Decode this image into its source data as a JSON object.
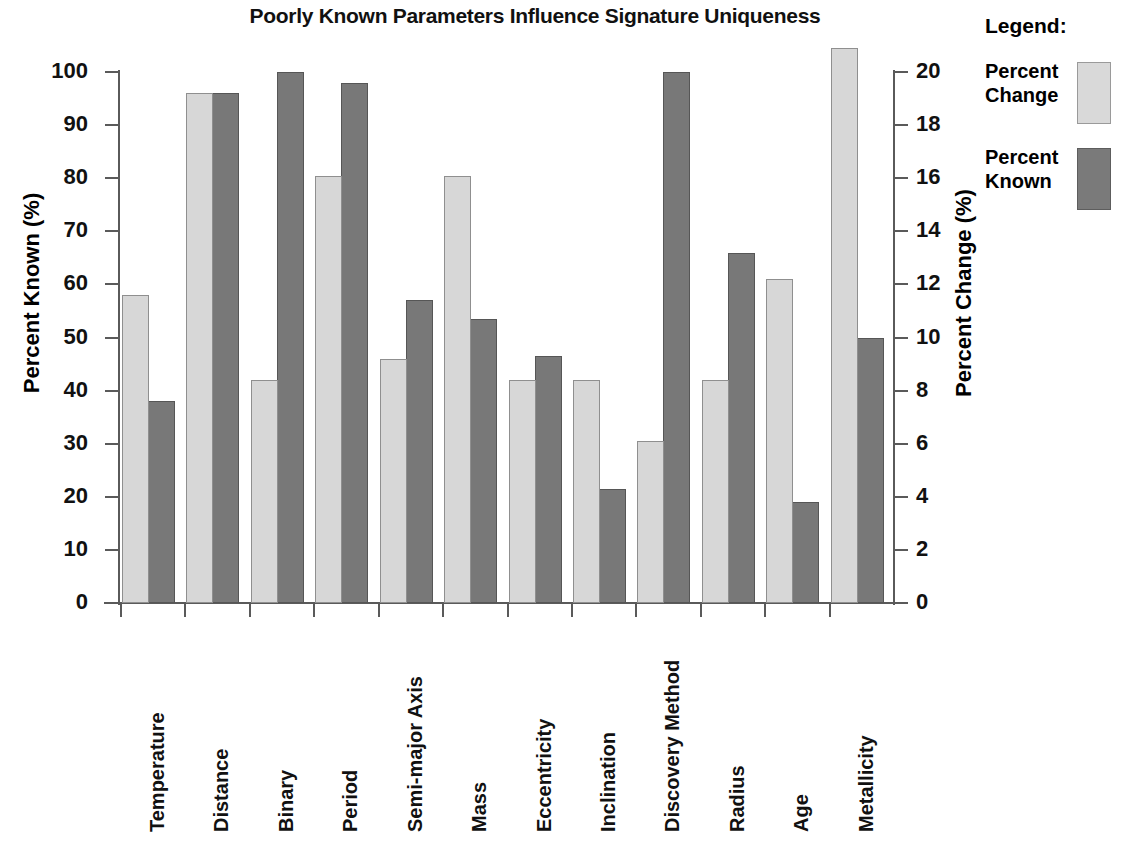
{
  "chart_data": {
    "type": "bar",
    "title": "Poorly Known Parameters Influence Signature Uniqueness",
    "xlabel": "",
    "ylabel": "Percent Known (%)",
    "y2label": "Percent Change (%)",
    "ylim": [
      0,
      100
    ],
    "y2lim": [
      0,
      20
    ],
    "yticks": [
      "0",
      "10",
      "20",
      "30",
      "40",
      "50",
      "60",
      "70",
      "80",
      "90",
      "100"
    ],
    "y2ticks": [
      "0",
      "2",
      "4",
      "6",
      "8",
      "10",
      "12",
      "14",
      "16",
      "18",
      "20"
    ],
    "grid": false,
    "legend_position": "right",
    "categories": [
      "Temperature",
      "Distance",
      "Binary",
      "Period",
      "Semi-major Axis",
      "Mass",
      "Eccentricity",
      "Inclination",
      "Discovery Method",
      "Radius",
      "Age",
      "Metallicity"
    ],
    "series": [
      {
        "name": "Percent Change",
        "axis": "left",
        "color": "#d7d7d7",
        "values": [
          58,
          96,
          42,
          80.5,
          46,
          80.5,
          42,
          42,
          30.5,
          42,
          61,
          104.5
        ]
      },
      {
        "name": "Percent Known",
        "axis": "right",
        "color": "#787878",
        "values": [
          7.6,
          19.2,
          20.0,
          19.6,
          11.4,
          10.7,
          9.3,
          4.3,
          20.0,
          13.2,
          3.8,
          10.0
        ]
      }
    ]
  },
  "legend": {
    "title": "Legend:",
    "entries": [
      {
        "label": "Percent\nChange",
        "swatch": "light"
      },
      {
        "label": "Percent\nKnown",
        "swatch": "dark"
      }
    ]
  }
}
